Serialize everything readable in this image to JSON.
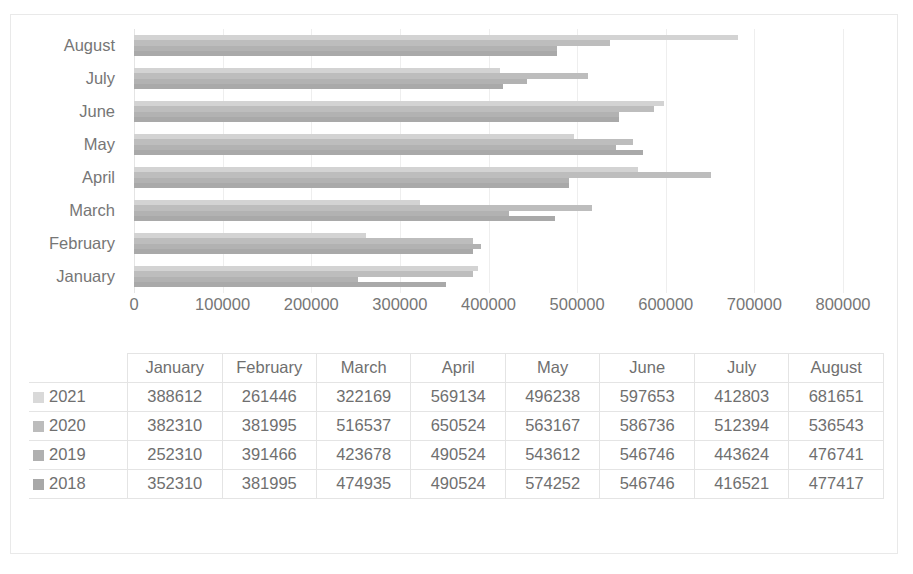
{
  "cropped_top_text": "",
  "chart_data": {
    "type": "bar",
    "orientation": "horizontal",
    "title": "",
    "xlabel": "",
    "ylabel": "",
    "xlim": [
      0,
      800000
    ],
    "xticks": [
      "0",
      "100000",
      "200000",
      "300000",
      "400000",
      "500000",
      "600000",
      "700000",
      "800000"
    ],
    "xtick_values": [
      0,
      100000,
      200000,
      300000,
      400000,
      500000,
      600000,
      700000,
      800000
    ],
    "grid": true,
    "grid_axis": "x",
    "legend": "data-table",
    "categories": [
      "August",
      "July",
      "June",
      "May",
      "April",
      "March",
      "February",
      "January"
    ],
    "table_categories": [
      "January",
      "February",
      "March",
      "April",
      "May",
      "June",
      "July",
      "August"
    ],
    "series": [
      {
        "name": "2021",
        "color": "#d3d3d3",
        "values": [
          388612,
          261446,
          322169,
          569134,
          496238,
          597653,
          412803,
          681651
        ]
      },
      {
        "name": "2020",
        "color": "#bdbdbd",
        "values": [
          382310,
          381995,
          516537,
          650524,
          563167,
          586736,
          512394,
          536543
        ]
      },
      {
        "name": "2019",
        "color": "#b2b2b2",
        "values": [
          252310,
          391466,
          423678,
          490524,
          543612,
          546746,
          443624,
          476741
        ]
      },
      {
        "name": "2018",
        "color": "#a9a9a9",
        "values": [
          352310,
          381995,
          474935,
          490524,
          574252,
          546746,
          416521,
          477417
        ]
      }
    ]
  },
  "data_table": {
    "corner": "",
    "columns": [
      "January",
      "February",
      "March",
      "April",
      "May",
      "June",
      "July",
      "August"
    ],
    "rows": [
      {
        "label": "2021",
        "swatch": "legend-swatch-2021",
        "cells": [
          "388612",
          "261446",
          "322169",
          "569134",
          "496238",
          "597653",
          "412803",
          "681651"
        ]
      },
      {
        "label": "2020",
        "swatch": "legend-swatch-2020",
        "cells": [
          "382310",
          "381995",
          "516537",
          "650524",
          "563167",
          "586736",
          "512394",
          "536543"
        ]
      },
      {
        "label": "2019",
        "swatch": "legend-swatch-2019",
        "cells": [
          "252310",
          "391466",
          "423678",
          "490524",
          "543612",
          "546746",
          "443624",
          "476741"
        ]
      },
      {
        "label": "2018",
        "swatch": "legend-swatch-2018",
        "cells": [
          "352310",
          "381995",
          "474935",
          "490524",
          "574252",
          "546746",
          "416521",
          "477417"
        ]
      }
    ]
  }
}
